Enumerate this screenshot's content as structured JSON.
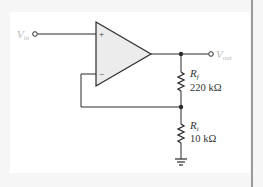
{
  "diagram": {
    "type": "non-inverting op-amp amplifier",
    "colors": {
      "wire": "#2b2b2b",
      "opamp_fill": "#ececec",
      "terminal_label": "#b8b8b8",
      "component_label": "#333333",
      "background": "#f6f6f6",
      "panel": "#ffffff",
      "border": "#9a9a9a"
    },
    "input": {
      "label_main": "V",
      "label_sub": "in"
    },
    "output": {
      "label_main": "V",
      "label_sub": "out"
    },
    "opamp": {
      "plus_sign": "+",
      "minus_sign": "−"
    },
    "resistors": [
      {
        "id": "Rf",
        "label_main": "R",
        "label_sub": "f",
        "value": "220 kΩ"
      },
      {
        "id": "Ri",
        "label_main": "R",
        "label_sub": "i",
        "value": "10 kΩ"
      }
    ]
  }
}
